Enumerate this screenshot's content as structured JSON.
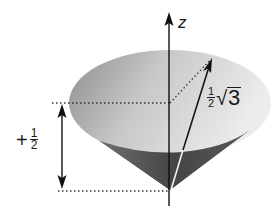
{
  "diagram": {
    "type": "vector-model-cone",
    "axis_label": "z",
    "vector_length_label": {
      "fraction": {
        "numerator": "1",
        "denominator": "2"
      },
      "radical_symbol": "√",
      "radicand": "3"
    },
    "projection_label": {
      "sign": "+",
      "fraction": {
        "numerator": "1",
        "denominator": "2"
      }
    },
    "colors": {
      "cone_top_light": "#e6e6e6",
      "cone_top_dark": "#9a9a9a",
      "cone_side_light": "#7a7a7a",
      "cone_side_dark": "#3e3e3e",
      "lines": "#111111",
      "dotted": "#333333"
    }
  }
}
